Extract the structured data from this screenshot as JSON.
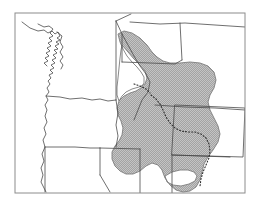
{
  "figure": {
    "type": "distribution-range-map",
    "region": "Pacific Northwest and Northern Rocky Mountains, United States",
    "background_color": "#ffffff",
    "line_color": "#4a4a4a",
    "frame_color": "#8c8c8c",
    "shade_fill_color": "#9e9e9e",
    "shade_stipple_color": "#bdbdbd",
    "dotted_line_color": "#2b2b2b",
    "title": "",
    "caption": "",
    "labels": [],
    "legend": []
  },
  "frame": {
    "name": "map-border",
    "x": 15,
    "y": 13,
    "width": 230,
    "height": 180,
    "stroke_width": 1
  },
  "map_features": {
    "coastline_name": "pacific-coastline",
    "state_boundaries_name": "state-boundary-lines",
    "shaded_range_name": "shaded-distribution-range",
    "dotted_boundary_name": "dotted-subrange-boundary",
    "unshaded_hole_name": "unshaded-interior-area"
  },
  "geometry": {
    "coastline_path": "M 22 22 L 30 28 L 38 31 L 44 30 L 48 33 L 52 31 L 55 34 L 58 32 L 60 36 L 57 38 L 60 40 L 56 42 L 59 44 L 55 46 L 58 49 L 54 50 L 57 53 L 53 55 L 56 58 L 52 60 L 55 63 L 51 65 L 54 68 L 50 70 L 53 73 L 49 75 L 51 78 L 48 81 L 50 84 L 47 88 L 49 92 L 46 96 L 48 100 L 45 105 L 47 110 L 45 116 L 47 122 L 44 128 L 46 134 L 43 140 L 45 147 L 42 154 L 44 161 L 41 168 L 43 175 L 41 182 L 44 188 L 46 192",
    "inner_coast_path": "M 38 24 L 44 27 L 49 26 L 53 29 L 50 33 L 53 36 L 49 38 L 52 41 L 48 43 L 51 46 L 47 48 L 50 51 L 46 53 L 49 56 L 45 58 L 48 61 L 44 63 L 47 66",
    "puget_path": "M 57 32 L 62 36 L 60 42 L 63 47 L 60 52 L 63 57 L 60 61 L 63 65 L 61 69",
    "wa_or_border": "M 46 96 L 60 97 L 70 99 L 82 98 L 92 100 L 100 99 L 108 101 L 116 100",
    "wa_east_border": "M 116 21 L 116 100",
    "or_ca_border": "M 45 147 L 60 147 L 75 147 L 90 148 L 100 148",
    "or_id_border": "M 116 100 L 118 113 L 116 125 L 118 136 L 116 147",
    "id_nv_border": "M 100 148 L 100 175",
    "nv_ca_border": "M 100 175 L 110 192",
    "ca_nv_diag": "M 45 147 L 45 192",
    "ut_nv_border": "M 100 148 L 140 149",
    "north_border": "M 116 21 L 131 14",
    "mt_border_1": "M 130 22 L 160 24 L 185 23 L 215 25 L 245 27",
    "mt_border_2": "M 180 23 L 182 60",
    "mt_wy_border": "M 155 105 L 185 107 L 215 108 L 245 110",
    "wy_box": "M 175 105 L 245 108 L 243 157 L 172 155 Z",
    "wy_south": "M 172 155 L 200 156 L 230 157",
    "ut_co_border": "M 172 155 L 172 193",
    "ut_south": "M 140 149 L 140 193",
    "id_mt_divide": "M 116 21 L 122 34 L 128 45 L 134 56 L 140 66 L 146 74 L 150 82 L 148 92 L 142 100 L 138 110 L 134 120",
    "mt_id_line2": "M 122 34 L 122 62",
    "mt_internal": "M 122 62 L 150 63 L 175 64 L 182 60",
    "shaded_range_path": "M 118 34 L 124 31 L 132 33 L 140 38 L 147 45 L 152 52 L 157 57 L 163 61 L 170 63 L 180 63 L 190 62 L 200 63 L 208 66 L 214 72 L 216 80 L 214 88 L 210 95 L 208 102 L 210 110 L 214 118 L 218 126 L 220 134 L 218 142 L 213 150 L 208 157 L 204 164 L 202 172 L 200 180 L 196 187 L 190 191 L 183 192 L 176 190 L 170 185 L 165 178 L 162 170 L 158 165 L 152 163 L 146 166 L 140 171 L 133 174 L 126 174 L 120 171 L 115 166 L 112 159 L 112 152 L 115 146 L 119 141 L 122 135 L 123 128 L 121 121 L 118 115 L 117 108 L 119 101 L 124 96 L 130 93 L 136 91 L 141 88 L 144 83 L 144 77 L 141 72 L 137 67 L 132 62 L 127 56 L 123 49 L 120 42 Z",
    "unshaded_hole_path": "M 122 45 L 128 52 L 134 59 L 140 65 L 145 71 L 147 78 L 145 84 L 139 87 L 132 89 L 126 92 L 122 96 L 119 101 L 117 95 L 117 87 L 118 78 L 119 68 L 120 58 L 121 50 Z",
    "unshaded_notch_path": "M 165 176 L 172 172 L 180 170 L 188 170 L 194 172 L 197 176 L 195 181 L 189 184 L 181 186 L 173 185 L 167 182 Z",
    "dotted_divide_path": "M 151 95 L 156 99 L 160 104 L 163 110 L 166 117 L 170 123 L 175 128 L 181 131 L 188 132 L 195 132 L 201 134 L 206 138 L 209 144 L 210 151 L 209 158 L 206 165 L 203 172 L 201 179 L 200 186",
    "dotted_upper_path": "M 134 84 L 140 86 L 146 89 L 150 93"
  }
}
